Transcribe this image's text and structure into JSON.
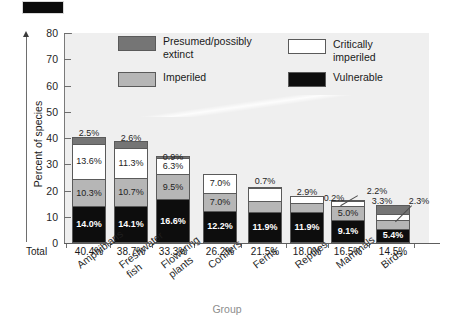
{
  "chart_data": {
    "type": "bar",
    "subtype": "stacked-bar",
    "title": "",
    "xlabel": "Group",
    "ylabel": "Percent of species",
    "ylim": [
      0,
      80
    ],
    "yticks": [
      0,
      10,
      20,
      30,
      40,
      50,
      60,
      70,
      80
    ],
    "grid": false,
    "legend_position": "inside-top",
    "total_row_label": "Total",
    "categories": [
      "Amphibians",
      "Freshwater\nfish",
      "Flowering\nplants",
      "Conifers",
      "Ferns",
      "Reptiles",
      "Mammals",
      "Birds"
    ],
    "totals": [
      "40.4%",
      "38.7%",
      "33.3%",
      "26.2%",
      "21.5%",
      "18.0%",
      "16.5%",
      "14.5%"
    ],
    "series": [
      {
        "name": "Vulnerable",
        "color": "#0d0d0d",
        "values": [
          14.0,
          14.1,
          16.6,
          12.2,
          11.9,
          11.9,
          9.1,
          5.4
        ],
        "labels": [
          "14.0%",
          "14.1%",
          "16.6%",
          "12.2%",
          "11.9%",
          "11.9%",
          "9.1%",
          "5.4%"
        ]
      },
      {
        "name": "Imperiled",
        "color": "#b6b6b6",
        "values": [
          10.3,
          10.7,
          9.5,
          7.0,
          4.0,
          3.2,
          5.0,
          3.5
        ],
        "labels": [
          "10.3%",
          "10.7%",
          "9.5%",
          "7.0%",
          "4.0%",
          "3.2%",
          "5.0%",
          "3.5%"
        ]
      },
      {
        "name": "Critically imperiled",
        "color": "#ffffff",
        "values": [
          13.6,
          11.3,
          6.3,
          7.0,
          4.9,
          2.9,
          2.2,
          2.3
        ],
        "labels": [
          "13.6%",
          "11.3%",
          "6.3%",
          "7.0%",
          "4.9%",
          "2.9%",
          "2.2%",
          "2.3%"
        ]
      },
      {
        "name": "Presumed/possibly extinct",
        "color": "#757575",
        "values": [
          2.5,
          2.6,
          0.9,
          0.0,
          0.7,
          0.0,
          0.2,
          3.3
        ],
        "labels": [
          "2.5%",
          "2.6%",
          "0.9%",
          "",
          "0.7%",
          "",
          "0.2%",
          "3.3%"
        ]
      }
    ]
  },
  "legend": {
    "items": [
      {
        "label": "Presumed/possibly\nextinct",
        "swatch": "ext"
      },
      {
        "label": "Critically imperiled",
        "swatch": "crit"
      },
      {
        "label": "Imperiled",
        "swatch": "imper"
      },
      {
        "label": "Vulnerable",
        "swatch": "vuln"
      }
    ]
  },
  "axes": {
    "y_label": "Percent of species",
    "x_label": "Group",
    "y_tick_labels": [
      "80",
      "70",
      "60",
      "50",
      "40",
      "30",
      "20",
      "10",
      "0"
    ],
    "total_label": "Total"
  },
  "colors": {
    "plot_background": "#efefef",
    "page_background": "#ffffff",
    "vulnerable": "#0d0d0d",
    "imperiled": "#b6b6b6",
    "critically_imperiled": "#ffffff",
    "extinct": "#757575",
    "axis": "#6e6e6e"
  }
}
